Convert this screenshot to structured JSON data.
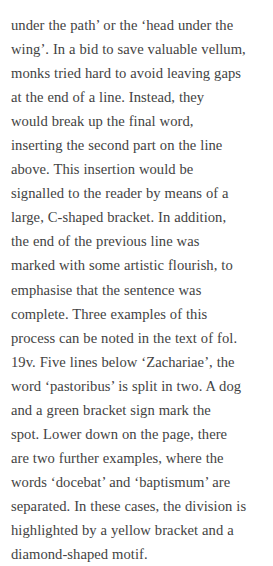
{
  "document": {
    "type": "prose-excerpt",
    "background_color": "#ffffff",
    "text_color": "#434343",
    "topic": "Medieval manuscript conventions for splitting words at line ends",
    "line_count": 20,
    "full_text": "under the path’ or the ‘head under the wing’. In a bid to save valuable vellum, monks tried hard to avoid leaving gaps at the end of a line. Instead, they would break up the final word, inserting the second part on the line above. This insertion would be signalled to the reader by means of a large, C-shaped bracket. In addition, the end of the previous line was marked with some artistic flourish, to emphasise that the sentence was complete. Three examples of this process can be noted in the text of fol. 19v. Five lines below ‘Zachariae’, the word ‘pastoribus’ is split in two. A dog and a green bracket sign mark the spot. Lower down on the page, there are two further examples, where the words ‘docebat’ and ‘baptismum’ are separated. In these cases, the division is highlighted by a yellow bracket and a diamond-shaped motif.",
    "lines": [
      "under the path’ or the ‘head under the",
      "wing’. In a bid to save valuable vellum,",
      "monks tried hard to avoid leaving gaps",
      "at the end of a line. Instead, they",
      "would break up the final word,",
      "inserting the second part on the line",
      "above. This insertion would be",
      "signalled to the reader by means of a",
      "large, C-shaped bracket. In addition,",
      "the end of the previous line was",
      "marked with some artistic flourish, to",
      "emphasise that the sentence was",
      "complete. Three examples of this",
      "process can be noted in the text of fol.",
      "19v. Five lines below ‘Zachariae’, the",
      "word ‘pastoribus’ is split in two. A dog",
      "and a green bracket sign mark the",
      "spot. Lower down on the page, there",
      "are two further examples, where the",
      "words ‘docebat’ and ‘baptismum’ are",
      "separated. In these cases, the division is",
      "highlighted by a yellow bracket and a",
      "diamond-shaped motif."
    ]
  }
}
